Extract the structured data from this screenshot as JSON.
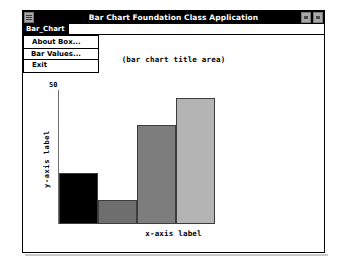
{
  "window": {
    "title": "Bar Chart Foundation Class Application",
    "system_menu_icon": "system-menu-icon",
    "controls": [
      {
        "name": "minimize-button",
        "glyph": "minimize-icon"
      },
      {
        "name": "maximize-button",
        "glyph": "maximize-icon"
      }
    ]
  },
  "menu_bar": {
    "items": [
      {
        "label": "Bar_Chart",
        "selected": true
      }
    ]
  },
  "dropdown": {
    "open": true,
    "items": [
      {
        "label": "About Box...",
        "highlighted": false
      },
      {
        "label": "Bar Values...",
        "highlighted": true
      },
      {
        "label": "Exit",
        "highlighted": false
      }
    ]
  },
  "chart_data": {
    "type": "bar",
    "title": "(bar chart title area)",
    "xlabel": "x-axis label",
    "ylabel": "y-axis label",
    "ylim": [
      0,
      50
    ],
    "ymax_tick_label": "50",
    "grid": false,
    "legend": "none",
    "categories": [
      "1",
      "2",
      "3",
      "4"
    ],
    "values": [
      19,
      9,
      37,
      47
    ],
    "bar_colors": [
      "#000000",
      "#6e6e6e",
      "#7d7d7d",
      "#b4b4b4"
    ],
    "bar_border_color": "#3c3c3c"
  }
}
